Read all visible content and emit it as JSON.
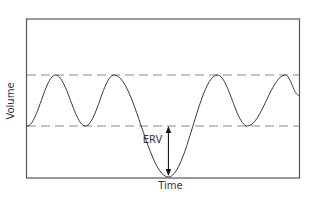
{
  "diagram": {
    "title": "",
    "y_axis_label": "Volume",
    "x_axis_label": "Time",
    "annotation_label": "ERV",
    "annotation_meaning": "expiratory reserve volume",
    "reference_lines": [
      {
        "name": "upper-tidal-level",
        "style": "dashed",
        "level": 1.0
      },
      {
        "name": "lower-tidal-level",
        "style": "dashed",
        "level": 0.0
      }
    ],
    "waveform": {
      "description": "breathing volume trace oscillating between the dashed tidal levels, with one deep exhalation dipping to the bottom (minimum) before resuming",
      "keypoints": [
        {
          "t": 0.0,
          "v": 0.0,
          "kind": "start"
        },
        {
          "t": 0.105,
          "v": 1.0,
          "kind": "peak"
        },
        {
          "t": 0.215,
          "v": 0.0,
          "kind": "trough"
        },
        {
          "t": 0.32,
          "v": 1.0,
          "kind": "peak"
        },
        {
          "t": 0.52,
          "v": -1.0,
          "kind": "deep-trough"
        },
        {
          "t": 0.7,
          "v": 1.0,
          "kind": "peak"
        },
        {
          "t": 0.81,
          "v": 0.0,
          "kind": "trough"
        },
        {
          "t": 0.95,
          "v": 1.0,
          "kind": "peak"
        },
        {
          "t": 1.0,
          "v": 0.6,
          "kind": "end"
        }
      ],
      "v_range": [
        -1.0,
        2.0
      ]
    },
    "erv_arrow": {
      "t": 0.52,
      "from_v": 0.0,
      "to_v": -1.0,
      "double_headed": true
    }
  },
  "colors": {
    "frame": "#555555",
    "dashed_lines": "#8a8a8a",
    "curve": "#3a3a3a",
    "arrow": "#1a1a1a",
    "text": "#333333"
  }
}
